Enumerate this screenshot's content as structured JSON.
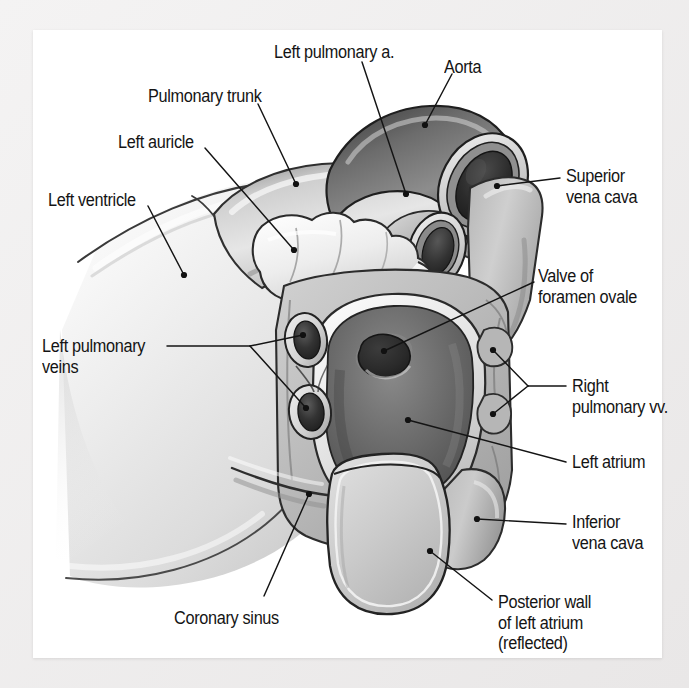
{
  "figure": {
    "kind": "anatomical-illustration",
    "style": "grayscale medical illustration",
    "page_background": "#ffffff",
    "outer_background": "#eceaea",
    "ink_color": "#141414"
  },
  "labels": [
    {
      "id": "left-pulmonary-a",
      "text": "Left pulmonary a.",
      "x": 274,
      "y": 42,
      "lines": [
        "Left pulmonary a."
      ]
    },
    {
      "id": "aorta",
      "text": "Aorta",
      "x": 444,
      "y": 57,
      "lines": [
        "Aorta"
      ]
    },
    {
      "id": "pulmonary-trunk",
      "text": "Pulmonary trunk",
      "x": 148,
      "y": 86,
      "lines": [
        "Pulmonary trunk"
      ]
    },
    {
      "id": "left-auricle",
      "text": "Left auricle",
      "x": 118,
      "y": 132,
      "lines": [
        "Left auricle"
      ]
    },
    {
      "id": "superior-vena-cava",
      "text": "Superior vena cava",
      "x": 566,
      "y": 166,
      "lines": [
        "Superior",
        "vena cava"
      ]
    },
    {
      "id": "left-ventricle",
      "text": "Left ventricle",
      "x": 48,
      "y": 190,
      "lines": [
        "Left ventricle"
      ]
    },
    {
      "id": "valve-foramen-ovale",
      "text": "Valve of foramen ovale",
      "x": 538,
      "y": 266,
      "lines": [
        "Valve of",
        "foramen ovale"
      ]
    },
    {
      "id": "left-pulmonary-veins",
      "text": "Left pulmonary veins",
      "x": 42,
      "y": 336,
      "lines": [
        "Left pulmonary",
        "veins"
      ]
    },
    {
      "id": "right-pulmonary-vv",
      "text": "Right pulmonary vv.",
      "x": 572,
      "y": 376,
      "lines": [
        "Right",
        "pulmonary vv."
      ]
    },
    {
      "id": "left-atrium",
      "text": "Left atrium",
      "x": 572,
      "y": 452,
      "lines": [
        "Left atrium"
      ]
    },
    {
      "id": "inferior-vena-cava",
      "text": "Inferior vena cava",
      "x": 572,
      "y": 512,
      "lines": [
        "Inferior",
        "vena cava"
      ]
    },
    {
      "id": "coronary-sinus",
      "text": "Coronary sinus",
      "x": 174,
      "y": 608,
      "lines": [
        "Coronary sinus"
      ]
    },
    {
      "id": "posterior-wall",
      "text": "Posterior wall of left atrium (reflected)",
      "x": 498,
      "y": 592,
      "lines": [
        "Posterior wall",
        "of left atrium",
        "(reflected)"
      ]
    }
  ],
  "leaders": [
    {
      "id": "leader-left-pulmonary-a",
      "from": [
        362,
        62
      ],
      "to": [
        406,
        194
      ],
      "dot": [
        406,
        194
      ]
    },
    {
      "id": "leader-aorta",
      "from": [
        452,
        74
      ],
      "to": [
        425,
        125
      ],
      "dot": [
        425,
        125
      ]
    },
    {
      "id": "leader-pulmonary-trunk",
      "from": [
        258,
        104
      ],
      "to": [
        296,
        184
      ],
      "dot": [
        296,
        184
      ]
    },
    {
      "id": "leader-left-auricle",
      "from": [
        205,
        148
      ],
      "to": [
        294,
        250
      ],
      "dot": [
        294,
        250
      ]
    },
    {
      "id": "leader-superior-vena-cava",
      "from": [
        560,
        178
      ],
      "to": [
        497,
        186
      ],
      "dot": [
        497,
        186
      ]
    },
    {
      "id": "leader-left-ventricle",
      "from": [
        148,
        206
      ],
      "to": [
        184,
        275
      ],
      "dot": [
        184,
        275
      ]
    },
    {
      "id": "leader-valve-foramen-ovale",
      "from": [
        534,
        282
      ],
      "to": [
        384,
        351
      ],
      "dot": [
        384,
        351
      ]
    },
    {
      "id": "leader-lpv-hub",
      "from": [
        167,
        346
      ],
      "to": [
        250,
        346
      ],
      "dot": null
    },
    {
      "id": "leader-lpv-upper",
      "from": [
        250,
        346
      ],
      "to": [
        303,
        335
      ],
      "dot": [
        303,
        335
      ]
    },
    {
      "id": "leader-lpv-lower",
      "from": [
        250,
        346
      ],
      "to": [
        306,
        408
      ],
      "dot": [
        306,
        408
      ]
    },
    {
      "id": "leader-rpv-hub",
      "from": [
        566,
        386
      ],
      "to": [
        528,
        386
      ],
      "dot": null
    },
    {
      "id": "leader-rpv-upper",
      "from": [
        528,
        386
      ],
      "to": [
        493,
        350
      ],
      "dot": [
        493,
        350
      ]
    },
    {
      "id": "leader-rpv-lower",
      "from": [
        528,
        386
      ],
      "to": [
        493,
        414
      ],
      "dot": [
        493,
        414
      ]
    },
    {
      "id": "leader-left-atrium",
      "from": [
        566,
        462
      ],
      "to": [
        408,
        420
      ],
      "dot": [
        408,
        420
      ]
    },
    {
      "id": "leader-inferior-vena-cava",
      "from": [
        566,
        524
      ],
      "to": [
        477,
        519
      ],
      "dot": [
        477,
        519
      ]
    },
    {
      "id": "leader-coronary-sinus",
      "from": [
        264,
        596
      ],
      "to": [
        309,
        494
      ],
      "dot": [
        309,
        494
      ]
    },
    {
      "id": "leader-posterior-wall",
      "from": [
        492,
        600
      ],
      "to": [
        430,
        551
      ],
      "dot": [
        430,
        551
      ]
    }
  ],
  "structures": [
    {
      "id": "left-ventricle-mass",
      "name": "Left ventricle",
      "tone": "light-gray-gradient"
    },
    {
      "id": "pulmonary-trunk-body",
      "name": "Pulmonary trunk",
      "tone": "mid-gray"
    },
    {
      "id": "aorta-tube",
      "name": "Aorta",
      "tone": "dark-gray cut tube"
    },
    {
      "id": "left-pulmonary-artery-tube",
      "name": "Left pulmonary a.",
      "tone": "mid-gray cut tube"
    },
    {
      "id": "left-auricle-lobe",
      "name": "Left auricle",
      "tone": "very-light lobulated"
    },
    {
      "id": "superior-vena-cava-body",
      "name": "Superior vena cava",
      "tone": "mid-gray"
    },
    {
      "id": "inferior-vena-cava-body",
      "name": "Inferior vena cava",
      "tone": "mid-gray"
    },
    {
      "id": "left-atrium-cavity",
      "name": "Left atrium",
      "tone": "dark-gray cavity"
    },
    {
      "id": "valve-foramen-ovale-crescent",
      "name": "Valve of foramen ovale",
      "tone": "dark crescent depression"
    },
    {
      "id": "left-pulmonary-vein-upper",
      "name": "Left pulmonary vein (upper)",
      "tone": "dark ostium, light rim"
    },
    {
      "id": "left-pulmonary-vein-lower",
      "name": "Left pulmonary vein (lower)",
      "tone": "dark ostium, light rim"
    },
    {
      "id": "right-pulmonary-vein-upper",
      "name": "Right pulmonary vein (upper)",
      "tone": "mid-gray"
    },
    {
      "id": "right-pulmonary-vein-lower",
      "name": "Right pulmonary vein (lower)",
      "tone": "mid-gray"
    },
    {
      "id": "coronary-sinus-groove",
      "name": "Coronary sinus",
      "tone": "shadowed groove"
    },
    {
      "id": "posterior-wall-flap",
      "name": "Posterior wall of left atrium (reflected)",
      "tone": "light-gray tongue flap"
    }
  ]
}
